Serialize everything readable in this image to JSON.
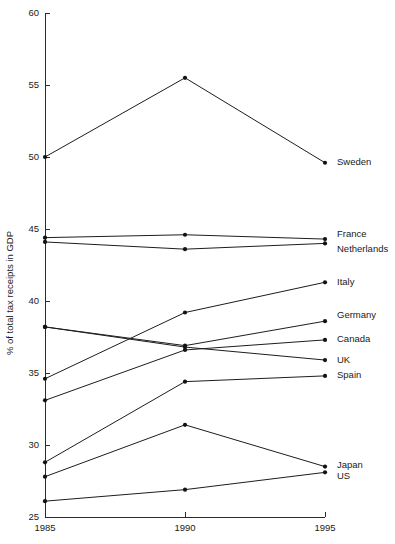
{
  "chart_data": {
    "type": "line",
    "title": "",
    "xlabel": "",
    "ylabel": "% of total tax receipts in GDP",
    "x": [
      1985,
      1990,
      1995
    ],
    "xticklabels": [
      "1985",
      "1990",
      "1995"
    ],
    "yticks": [
      25,
      30,
      35,
      40,
      45,
      50,
      55,
      60
    ],
    "yticklabels": [
      "25",
      "30",
      "35",
      "40",
      "45",
      "50",
      "55",
      "60"
    ],
    "ylim": [
      25,
      60
    ],
    "xlim": [
      1985,
      1995
    ],
    "grid": false,
    "legend_position": "right-inline-labels",
    "series": [
      {
        "name": "Sweden",
        "values": [
          50.0,
          55.5,
          49.6
        ]
      },
      {
        "name": "France",
        "values": [
          44.4,
          44.6,
          44.3
        ]
      },
      {
        "name": "Netherlands",
        "values": [
          44.1,
          43.6,
          44.0
        ]
      },
      {
        "name": "Italy",
        "values": [
          34.6,
          39.2,
          41.3
        ]
      },
      {
        "name": "Germany",
        "values": [
          38.2,
          36.9,
          38.6
        ]
      },
      {
        "name": "Canada",
        "values": [
          33.1,
          36.6,
          37.3
        ]
      },
      {
        "name": "UK",
        "values": [
          38.2,
          36.8,
          35.9
        ]
      },
      {
        "name": "Spain",
        "values": [
          28.8,
          34.4,
          34.8
        ]
      },
      {
        "name": "Japan",
        "values": [
          27.8,
          31.4,
          28.5
        ]
      },
      {
        "name": "US",
        "values": [
          26.1,
          26.9,
          28.1
        ]
      }
    ]
  },
  "labels": {
    "Sweden": "Sweden",
    "France": "France",
    "Netherlands": "Netherlands",
    "Italy": "Italy",
    "Germany": "Germany",
    "Canada": "Canada",
    "UK": "UK",
    "Spain": "Spain",
    "Japan": "Japan",
    "US": "US"
  },
  "label_anchor_y": {
    "Sweden": 49.6,
    "France": 44.6,
    "Netherlands": 43.6,
    "Italy": 41.3,
    "Germany": 39.0,
    "Canada": 37.3,
    "UK": 35.9,
    "Spain": 34.8,
    "Japan": 28.6,
    "US": 27.8
  },
  "colors": {
    "line": "#1d1d1d",
    "marker": "#121212",
    "axis": "#2b2b2b",
    "text": "#1a1a1a",
    "background": "#ffffff"
  }
}
